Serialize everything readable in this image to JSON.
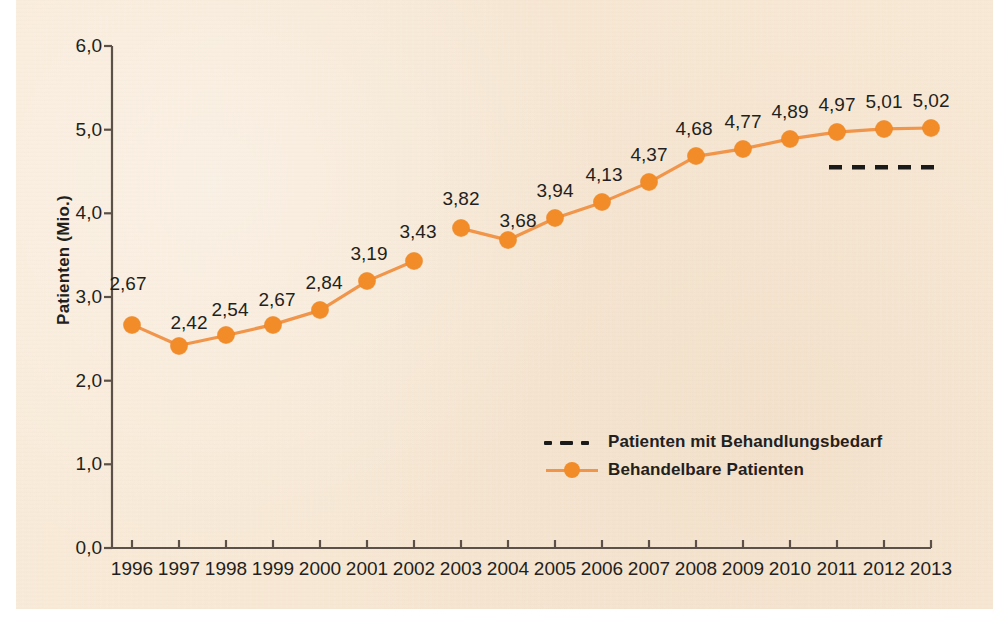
{
  "colors": {
    "background_paper": "#f8e9d7",
    "page_background": "#ffffff",
    "series_orange": "#f28c28",
    "series_line": "#f0954a",
    "dashed_black": "#1a1a1a",
    "axis": "#5b5148",
    "text": "#231f20"
  },
  "axes": {
    "y_axis_title": "Patienten (Mio.)",
    "y_ticks": [
      "0,0",
      "1,0",
      "2,0",
      "3,0",
      "4,0",
      "5,0",
      "6,0"
    ],
    "y_tick_values": [
      0.0,
      1.0,
      2.0,
      3.0,
      4.0,
      5.0,
      6.0
    ],
    "x_ticks": [
      "1996",
      "1997",
      "1998",
      "1999",
      "2000",
      "2001",
      "2002",
      "2003",
      "2004",
      "2005",
      "2006",
      "2007",
      "2008",
      "2009",
      "2010",
      "2011",
      "2012",
      "2013"
    ]
  },
  "legend": {
    "position": "inside-center-right",
    "items": [
      {
        "label": "Patienten mit Behandlungsbedarf",
        "style": "dashed",
        "color": "#1a1a1a"
      },
      {
        "label": "Behandelbare Patienten",
        "style": "line-marker",
        "color": "#f28c28"
      }
    ]
  },
  "chart_data": {
    "type": "line",
    "title": "",
    "subtitle": "",
    "xlabel": "",
    "ylabel": "Patienten (Mio.)",
    "ylim": [
      0.0,
      6.0
    ],
    "xlim": [
      "1996",
      "2013"
    ],
    "grid": false,
    "legend_position": "inside-center-right",
    "x": [
      "1996",
      "1997",
      "1998",
      "1999",
      "2000",
      "2001",
      "2002",
      "2003",
      "2004",
      "2005",
      "2006",
      "2007",
      "2008",
      "2009",
      "2010",
      "2011",
      "2012",
      "2013"
    ],
    "series": [
      {
        "name": "Behandelbare Patienten",
        "color": "#f28c28",
        "style": "line-marker",
        "values": [
          2.67,
          2.42,
          2.54,
          2.67,
          2.84,
          3.19,
          3.43,
          3.82,
          3.68,
          3.94,
          4.13,
          4.37,
          4.68,
          4.77,
          4.89,
          4.97,
          5.01,
          5.02
        ],
        "labels": [
          "2,67",
          "2,42",
          "2,54",
          "2,67",
          "2,84",
          "3,19",
          "3,43",
          "3,82",
          "3,68",
          "3,94",
          "4,13",
          "4,37",
          "4,68",
          "4,77",
          "4,89",
          "4,97",
          "5,01",
          "5,02"
        ],
        "line_break_after": "2002"
      },
      {
        "name": "Patienten mit Behandlungsbedarf",
        "color": "#1a1a1a",
        "style": "dashed",
        "x_range": [
          "2011",
          "2013"
        ],
        "value": 4.55,
        "labels": []
      }
    ]
  }
}
